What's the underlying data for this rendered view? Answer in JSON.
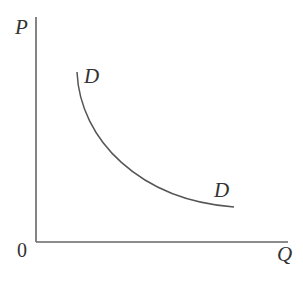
{
  "diagram": {
    "type": "demand-curve",
    "y_axis_label": "P",
    "x_axis_label": "Q",
    "origin_label": "0",
    "curve_label_top": "D",
    "curve_label_bottom": "D",
    "colors": {
      "axis": "#666666",
      "curve": "#555555",
      "text": "#333333"
    }
  }
}
